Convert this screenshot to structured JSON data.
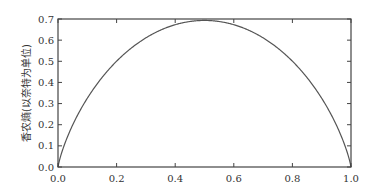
{
  "chart_data": {
    "type": "line",
    "title": "",
    "xlabel": "",
    "ylabel": "香农熵(以奈特为单位)",
    "xlim": [
      0.0,
      1.0
    ],
    "ylim": [
      0.0,
      0.7
    ],
    "xticks": [
      "0.0",
      "0.2",
      "0.4",
      "0.6",
      "0.8",
      "1.0"
    ],
    "yticks": [
      "0.0",
      "0.1",
      "0.2",
      "0.3",
      "0.4",
      "0.5",
      "0.6",
      "0.7"
    ],
    "grid": false,
    "legend": null,
    "series": [
      {
        "name": "binary entropy (nats)",
        "x": [
          0.0,
          0.01,
          0.05,
          0.1,
          0.2,
          0.3,
          0.4,
          0.5,
          0.6,
          0.7,
          0.8,
          0.9,
          0.95,
          0.99,
          1.0
        ],
        "y": [
          0.0,
          0.056,
          0.199,
          0.325,
          0.5,
          0.611,
          0.673,
          0.693,
          0.673,
          0.611,
          0.5,
          0.325,
          0.199,
          0.056,
          0.0
        ]
      }
    ]
  },
  "colors": {
    "line": "#555555",
    "axes": "#444444"
  }
}
